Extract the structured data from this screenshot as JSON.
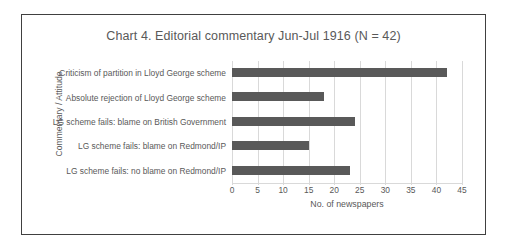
{
  "chart_data": {
    "type": "bar",
    "orientation": "horizontal",
    "title": "Chart 4. Editorial commentary Jun-Jul 1916 (N = 42)",
    "xlabel": "No. of newspapers",
    "ylabel": "Commentary / Attitude",
    "categories": [
      "Criticism of partition in Lloyd George scheme",
      "Absolute rejection of Lloyd George scheme",
      "LG scheme fails: blame on British Government",
      "LG scheme fails: blame on Redmond/IP",
      "LG scheme fails: no blame on Redmond/IP"
    ],
    "values": [
      42,
      18,
      24,
      15,
      23
    ],
    "xlim": [
      0,
      45
    ],
    "xticks": [
      0,
      5,
      10,
      15,
      20,
      25,
      30,
      35,
      40,
      45
    ],
    "xtick_labels": [
      "0",
      "5",
      "10",
      "15",
      "20",
      "25",
      "30",
      "35",
      "40",
      "45"
    ],
    "grid": true,
    "legend": false,
    "bar_color": "#595959",
    "grid_color": "#d9d9d9",
    "text_color": "#595959",
    "border_color": "#404040",
    "background": "#ffffff"
  }
}
